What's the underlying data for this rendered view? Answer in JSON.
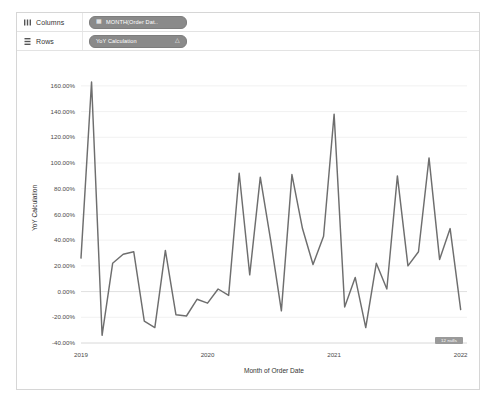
{
  "app": {
    "title": "Tableau Worksheet"
  },
  "shelves": [
    {
      "id": "columns",
      "label": "Columns",
      "icon": "columns-icon",
      "pill": {
        "label": "MONTH(Order Dat..",
        "icon": "calendar-icon"
      }
    },
    {
      "id": "rows",
      "label": "Rows",
      "icon": "rows-icon",
      "pill": {
        "label": "YoY Calculation",
        "icon": "delta-icon",
        "trailing": "△"
      }
    }
  ],
  "null_badge": {
    "label": "12 nulls"
  },
  "colors": {
    "line": "#6e6e6e",
    "gridline": "#ededed",
    "zero_line": "#e0e0e0",
    "pill_bg": "#8a8a8a",
    "text": "#4a4a4a",
    "panel_border": "#d6d6d6"
  },
  "chart_data": {
    "type": "line",
    "title": "",
    "xlabel": "Month of Order Date",
    "ylabel": "YoY Calculation",
    "ylim": [
      -40,
      170
    ],
    "ytick_labels": [
      "160.00%",
      "140.00%",
      "120.00%",
      "100.00%",
      "80.00%",
      "60.00%",
      "40.00%",
      "20.00%",
      "0.00%",
      "-20.00%",
      "-40.00%"
    ],
    "ytick_values": [
      160,
      140,
      120,
      100,
      80,
      60,
      40,
      20,
      0,
      -20,
      -40
    ],
    "xtick_labels": [
      "2019",
      "2020",
      "2021",
      "2022"
    ],
    "xtick_values": [
      0,
      12,
      24,
      36
    ],
    "grid": true,
    "legend": false,
    "series": [
      {
        "name": "YoY Calculation",
        "x": [
          0,
          1,
          2,
          3,
          4,
          5,
          6,
          7,
          8,
          9,
          10,
          11,
          12,
          13,
          14,
          15,
          16,
          17,
          18,
          19,
          20,
          21,
          22,
          23,
          24,
          25,
          26,
          27,
          28,
          29,
          30,
          31,
          32,
          33,
          34,
          35,
          36
        ],
        "values": [
          26,
          163,
          -34,
          22,
          29,
          31,
          -23,
          -28,
          32,
          -18,
          -19,
          -6,
          -9,
          2,
          -3,
          92,
          13,
          89,
          39,
          -15,
          91,
          49,
          21,
          43,
          138,
          -12,
          11,
          -28,
          22,
          2,
          90,
          20,
          31,
          104,
          25,
          49,
          -14
        ]
      }
    ]
  }
}
